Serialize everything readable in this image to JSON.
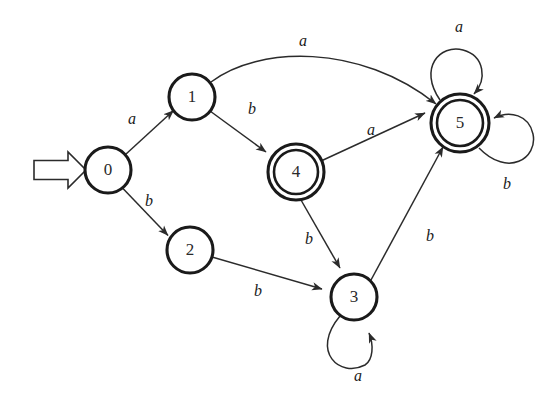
{
  "figure": {
    "background_color": "#ffffff",
    "stroke_color": "#2b2b2b",
    "node_stroke_color": "#1a1a1a",
    "label_color": "#1a1a1a",
    "width": 554,
    "height": 409
  },
  "alphabet": [
    "a",
    "b"
  ],
  "start_state": "0",
  "accepting_states": [
    "4",
    "5"
  ],
  "states": [
    {
      "id": "0",
      "label": "0",
      "x": 108,
      "y": 170,
      "r": 23,
      "accepting": false
    },
    {
      "id": "1",
      "label": "1",
      "x": 192,
      "y": 97,
      "r": 23,
      "accepting": false
    },
    {
      "id": "2",
      "label": "2",
      "x": 190,
      "y": 250,
      "r": 23,
      "accepting": false
    },
    {
      "id": "4",
      "label": "4",
      "x": 296,
      "y": 172,
      "r": 22,
      "r_outer": 28,
      "accepting": true
    },
    {
      "id": "3",
      "label": "3",
      "x": 354,
      "y": 297,
      "r": 23,
      "accepting": false
    },
    {
      "id": "5",
      "label": "5",
      "x": 460,
      "y": 123,
      "r": 23,
      "r_outer": 29,
      "accepting": true
    }
  ],
  "transitions": [
    {
      "id": "t0a",
      "from": "0",
      "to": "1",
      "symbol": "a",
      "label_x": 132,
      "label_y": 120
    },
    {
      "id": "t0b",
      "from": "0",
      "to": "2",
      "symbol": "b",
      "label_x": 149,
      "label_y": 202
    },
    {
      "id": "t1a",
      "from": "1",
      "to": "5",
      "symbol": "a",
      "label_x": 303,
      "label_y": 42,
      "curved": true
    },
    {
      "id": "t1b",
      "from": "1",
      "to": "4",
      "symbol": "b",
      "label_x": 252,
      "label_y": 110
    },
    {
      "id": "t2b",
      "from": "2",
      "to": "3",
      "symbol": "b",
      "label_x": 258,
      "label_y": 292
    },
    {
      "id": "t4a",
      "from": "4",
      "to": "5",
      "symbol": "a",
      "label_x": 371,
      "label_y": 131
    },
    {
      "id": "t4b",
      "from": "4",
      "to": "3",
      "symbol": "b",
      "label_x": 309,
      "label_y": 240
    },
    {
      "id": "t3b",
      "from": "3",
      "to": "5",
      "symbol": "b",
      "label_x": 430,
      "label_y": 237
    },
    {
      "id": "t3a",
      "from": "3",
      "to": "3",
      "symbol": "a",
      "label_x": 358,
      "label_y": 377,
      "self_loop": true
    },
    {
      "id": "t5a",
      "from": "5",
      "to": "5",
      "symbol": "a",
      "label_x": 459,
      "label_y": 28,
      "self_loop": true
    },
    {
      "id": "t5b",
      "from": "5",
      "to": "5",
      "symbol": "b",
      "label_x": 507,
      "label_y": 185,
      "self_loop": true
    }
  ],
  "start_marker": {
    "name": "start-arrow",
    "from_x": 34,
    "to_x": 85,
    "y": 170
  }
}
